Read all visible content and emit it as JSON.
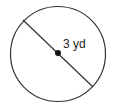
{
  "diagram": {
    "shape": "circle",
    "label": "3 yd",
    "measurement": {
      "value": 3,
      "unit": "yd",
      "type": "diameter"
    },
    "colors": {
      "stroke": "#222222",
      "background": "#ffffff"
    }
  }
}
